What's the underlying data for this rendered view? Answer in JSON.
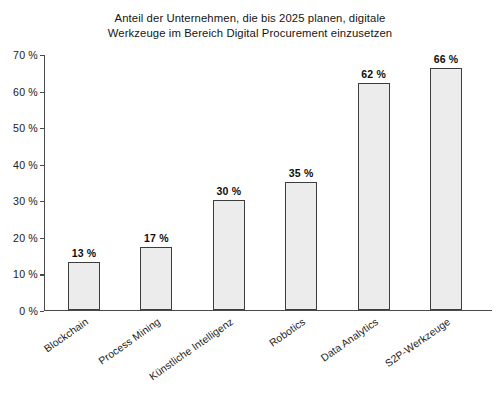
{
  "chart_data": {
    "type": "bar",
    "title": "Anteil der Unternehmen, die bis 2025 planen, digitale Werkzeuge im Bereich Digital Procurement einzusetzen",
    "title_lines": [
      "Anteil der Unternehmen, die bis 2025 planen, digitale",
      "Werkzeuge im Bereich Digital Procurement einzusetzen"
    ],
    "categories": [
      "Blockchain",
      "Process Mining",
      "Künstliche Intelligenz",
      "Robotics",
      "Data Analytics",
      "S2P-Werkzeuge"
    ],
    "values": [
      13,
      17,
      30,
      35,
      62,
      66
    ],
    "value_labels": [
      "13 %",
      "17 %",
      "30 %",
      "35 %",
      "62 %",
      "66 %"
    ],
    "xlabel": "",
    "ylabel": "",
    "ylim": [
      0,
      70
    ],
    "ytick_values": [
      0,
      10,
      20,
      30,
      40,
      50,
      60,
      70
    ],
    "ytick_labels": [
      "0 %",
      "10 %",
      "20 %",
      "30 %",
      "40 %",
      "50 %",
      "60 %",
      "70 %"
    ],
    "grid": false,
    "legend": false,
    "legend_position": "none",
    "unit": "%",
    "bar_fill_color": "#ececec",
    "bar_border_color": "#3d3d3d",
    "axis_color": "#4a4a4a",
    "background_color": "#ffffff",
    "text_color": "#1a1a1a"
  }
}
